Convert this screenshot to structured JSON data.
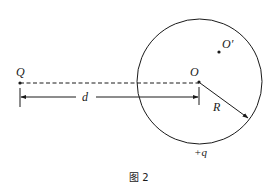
{
  "diagram": {
    "caption": "图 2",
    "labels": {
      "point_Q": "Q",
      "center_O": "O",
      "point_O_prime": "O′",
      "distance": "d",
      "radius": "R",
      "sphere_charge": "+q"
    },
    "elements": {
      "sphere": {
        "shape": "circle",
        "center": [
          199,
          81.5
        ],
        "radius": 62.5
      },
      "point_charge_Q": {
        "position": [
          20,
          83
        ]
      },
      "sphere_center_O": {
        "position": [
          199,
          82
        ]
      },
      "off_center_point_O_prime": {
        "position": [
          219,
          52
        ]
      },
      "dashed_line_Q_to_O": {
        "from": [
          20,
          83
        ],
        "to": [
          199,
          83
        ],
        "style": "dashed"
      },
      "distance_arrow_d": {
        "from": [
          20,
          97
        ],
        "to": [
          199,
          97
        ],
        "style": "double-headed"
      },
      "radius_arrow_R": {
        "from": [
          199,
          82
        ],
        "to": [
          248,
          118
        ]
      }
    },
    "colors": {
      "ink": "#1a1a1a",
      "background": "#ffffff"
    }
  }
}
